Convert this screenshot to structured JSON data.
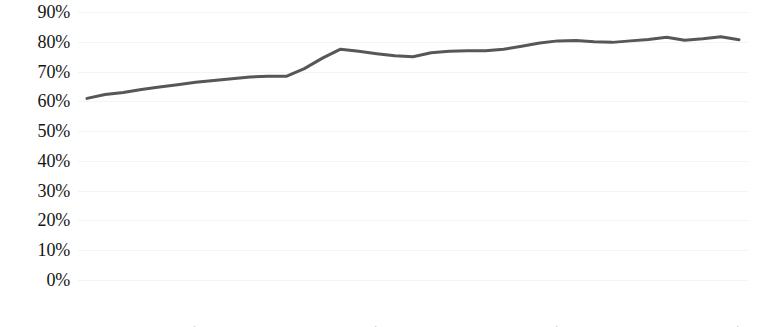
{
  "chart_data": {
    "type": "line",
    "title": "",
    "subtitle": "",
    "xlabel": "",
    "ylabel": "",
    "legend": [],
    "legend_position": "none",
    "grid": true,
    "grid_axis": "y",
    "ylim": [
      0,
      90
    ],
    "ytick_values": [
      90,
      80,
      70,
      60,
      50,
      40,
      30,
      20,
      10,
      0
    ],
    "ytick_labels": [
      "90%",
      "80%",
      "70%",
      "60%",
      "50%",
      "40%",
      "30%",
      "20%",
      "10%",
      "0%"
    ],
    "ytick_suffix": "%",
    "xtick_rotation": -90,
    "categories": [
      "1979",
      "1980",
      "1981",
      "1982",
      "1983",
      "1984",
      "1985",
      "1986",
      "1987",
      "1988",
      "1989",
      "1990",
      "1991",
      "1992",
      "1993",
      "1994",
      "1995",
      "1996",
      "1997",
      "1998",
      "1999",
      "2000",
      "2001",
      "2002",
      "2003",
      "2004",
      "2005",
      "2006",
      "2007",
      "2008",
      "2009",
      "2010",
      "2011",
      "2012",
      "2013",
      "2014",
      "2015"
    ],
    "series": [
      {
        "name": "",
        "color": "#575757",
        "line_width": 3,
        "markers": false,
        "values": [
          61.0,
          62.3,
          63.0,
          64.0,
          64.8,
          65.6,
          66.4,
          67.0,
          67.6,
          68.2,
          68.4,
          68.4,
          71.0,
          74.5,
          77.5,
          76.8,
          76.0,
          75.3,
          75.0,
          76.3,
          76.8,
          77.0,
          77.0,
          77.5,
          78.5,
          79.6,
          80.3,
          80.4,
          80.0,
          79.8,
          80.3,
          80.8,
          81.5,
          80.5,
          81.0,
          81.7,
          80.7
        ]
      }
    ],
    "x_first": "1979",
    "x_last": "2015",
    "point_count": 37,
    "value_min": 61.0,
    "value_max": 81.7
  },
  "colors": {
    "background": "#ffffff",
    "line": "#575757",
    "gridline": "#f4f4f4",
    "text": "#151515"
  }
}
